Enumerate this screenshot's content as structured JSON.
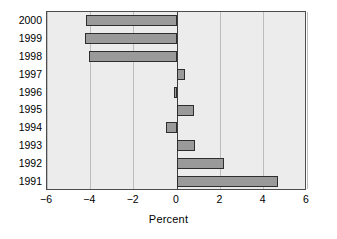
{
  "chart_data": {
    "type": "bar",
    "orientation": "horizontal",
    "title": "",
    "xlabel": "Percent",
    "ylabel": "",
    "categories": [
      "2000",
      "1999",
      "1998",
      "1997",
      "1996",
      "1995",
      "1994",
      "1993",
      "1992",
      "1991"
    ],
    "values": [
      -4.2,
      -4.25,
      -4.05,
      0.35,
      -0.15,
      0.8,
      -0.5,
      0.85,
      2.15,
      4.65
    ],
    "xlim": [
      -6,
      6
    ],
    "xticks": [
      -6,
      -4,
      -2,
      0,
      2,
      4,
      6
    ],
    "xtick_labels": [
      "−6",
      "−4",
      "−2",
      "0",
      "2",
      "4",
      "6"
    ],
    "grid": true,
    "grid_axis": "x",
    "legend": null,
    "zero_reference_line": 0,
    "colors": {
      "bar_fill": "#9a9a9a",
      "bar_edge": "#2e2e2e",
      "plot_background": "#ececec",
      "gridline": "#bdbdbd",
      "axis_frame": "#4d4d4d",
      "zero_line": "#3c3c3c",
      "text": "#000000",
      "figure_background": "#ffffff"
    }
  }
}
